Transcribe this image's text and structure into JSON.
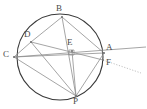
{
  "figure": {
    "width": 147,
    "height": 109,
    "background": "#ffffff",
    "stroke_circle": "#3a3a3a",
    "stroke_chord": "#8e8e8e",
    "stroke_ray": "#8e8e8e",
    "stroke_dotted": "#b0b0b0",
    "label_color": "#4a4a4a"
  },
  "labels": {
    "B": "B",
    "D": "D",
    "C": "C",
    "E": "E",
    "A": "A",
    "F": "F",
    "P": "P"
  },
  "points": {
    "B": {
      "x": 62,
      "y": 17,
      "label_x": 56,
      "label_y": 4
    },
    "D": {
      "x": 31,
      "y": 42,
      "label_x": 24,
      "label_y": 30
    },
    "C": {
      "x": 14,
      "y": 57,
      "label_x": 3,
      "label_y": 50
    },
    "E": {
      "x": 72,
      "y": 51,
      "label_x": 67,
      "label_y": 38
    },
    "A": {
      "x": 104,
      "y": 53,
      "label_x": 106,
      "label_y": 43
    },
    "F": {
      "x": 103,
      "y": 60,
      "label_x": 106,
      "label_y": 58
    },
    "P": {
      "x": 76,
      "y": 96,
      "label_x": 73,
      "label_y": 97
    }
  },
  "circle": {
    "cx": 60,
    "cy": 57,
    "r": 43
  },
  "segments": [
    {
      "name": "chord-B-D",
      "from": "B",
      "to": "D"
    },
    {
      "name": "chord-B-A",
      "from": "B",
      "to": "A"
    },
    {
      "name": "chord-B-P",
      "from": "B",
      "to": "P"
    },
    {
      "name": "chord-C-A",
      "from": "C",
      "to": "A"
    },
    {
      "name": "chord-C-D",
      "from": "C",
      "to": "D"
    },
    {
      "name": "chord-C-P",
      "from": "C",
      "to": "P"
    },
    {
      "name": "chord-D-F",
      "from": "D",
      "to": "F"
    },
    {
      "name": "chord-D-P",
      "from": "D",
      "to": "P"
    },
    {
      "name": "segment-E-P",
      "from": "E",
      "to": "P"
    },
    {
      "name": "segment-A-P",
      "from": "A",
      "to": "P"
    }
  ],
  "rays": [
    {
      "name": "ray-solid-right",
      "x1": 14,
      "y1": 57,
      "x2": 146,
      "y2": 47,
      "style": "solid"
    },
    {
      "name": "ray-dotted-right",
      "x1": 103,
      "y1": 60,
      "x2": 141,
      "y2": 73,
      "style": "dotted"
    }
  ],
  "marks": {
    "right_angle_at_E": {
      "x": 69,
      "y": 50,
      "size": 5
    }
  }
}
